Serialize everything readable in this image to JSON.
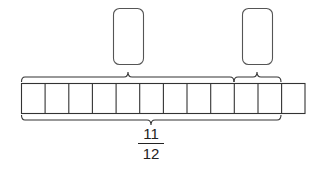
{
  "diagram": {
    "type": "tape-diagram",
    "total_cells": 12,
    "top_braces": [
      {
        "name": "left-part",
        "start_cell": 0,
        "end_cell": 9,
        "answer_box": ""
      },
      {
        "name": "right-part",
        "start_cell": 9,
        "end_cell": 11,
        "answer_box": ""
      }
    ],
    "bottom_brace": {
      "start_cell": 0,
      "end_cell": 11
    },
    "label": {
      "numerator": "11",
      "denominator": "12"
    },
    "stroke_color": "#333333",
    "box_color": "#555555"
  }
}
